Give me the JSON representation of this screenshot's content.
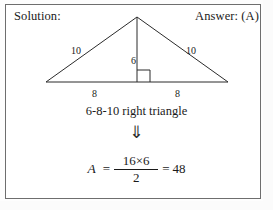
{
  "header": {
    "solution_label": "Solution:",
    "answer_label": "Answer: (A)"
  },
  "figure": {
    "shape_name": "isosceles-triangle-with-altitude",
    "labels": {
      "leg_left": "10",
      "leg_right": "10",
      "altitude": "6",
      "base_left": "8",
      "base_right": "8"
    },
    "right_angle_marker": true,
    "stroke_color": "#2b2b2b"
  },
  "caption": {
    "text": "6-8-10 right triangle"
  },
  "implies": {
    "glyph": "⇓",
    "icon_name": "double-down-arrow-icon"
  },
  "equation": {
    "variable": "A",
    "equals_1": "=",
    "numerator": "16×6",
    "denominator": "2",
    "equals_2": "=",
    "result": "48"
  }
}
